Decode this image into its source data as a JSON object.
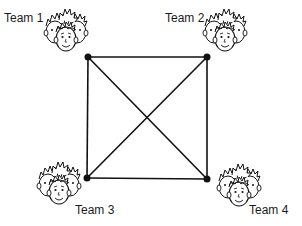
{
  "diagram": {
    "type": "complete-graph",
    "line_color": "#111111",
    "nodes": [
      {
        "id": "team1",
        "label": "Team 1",
        "x": 88,
        "y": 57
      },
      {
        "id": "team2",
        "label": "Team 2",
        "x": 207,
        "y": 57
      },
      {
        "id": "team3",
        "label": "Team 3",
        "x": 87,
        "y": 178
      },
      {
        "id": "team4",
        "label": "Team 4",
        "x": 207,
        "y": 179
      }
    ],
    "edges": [
      [
        "team1",
        "team2"
      ],
      [
        "team1",
        "team3"
      ],
      [
        "team1",
        "team4"
      ],
      [
        "team2",
        "team3"
      ],
      [
        "team2",
        "team4"
      ],
      [
        "team3",
        "team4"
      ]
    ],
    "icons": {
      "node_icon": "group-of-three-faces-icon"
    }
  }
}
